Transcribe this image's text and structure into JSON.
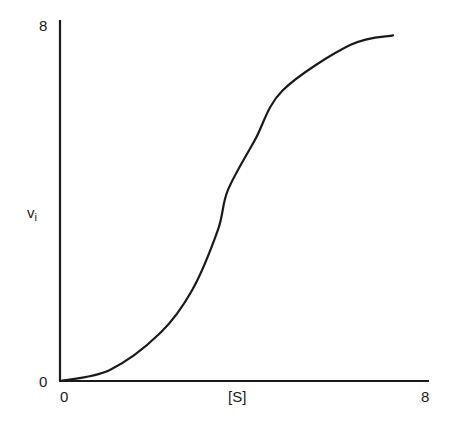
{
  "chart_data": {
    "type": "line",
    "title": "",
    "xlabel": "[S]",
    "ylabel": "v",
    "ylabel_subscript": "i",
    "xlim": [
      0,
      8
    ],
    "ylim": [
      0,
      8
    ],
    "x_ticks": [
      "0",
      "8"
    ],
    "y_ticks": [
      "0",
      "8"
    ],
    "grid": false,
    "legend": null,
    "series": [
      {
        "name": "sigmoidal velocity curve",
        "color": "#1a1a1a",
        "x": [
          0,
          1.09,
          2.19,
          2.89,
          3.45,
          3.67,
          4.26,
          4.87,
          6.34,
          7.28
        ],
        "y": [
          0,
          0.25,
          1.08,
          2.05,
          3.4,
          4.3,
          5.43,
          6.55,
          7.57,
          7.79
        ]
      }
    ]
  },
  "labels": {
    "y_max": "8",
    "y_min": "0",
    "x_min": "0",
    "x_max": "8",
    "x_axis": "[S]",
    "y_axis_main": "v",
    "y_axis_sub": "i"
  }
}
